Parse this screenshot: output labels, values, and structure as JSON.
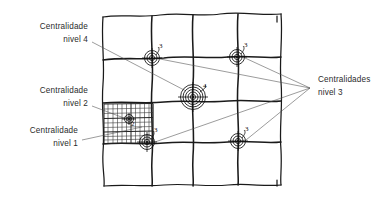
{
  "figure": {
    "type": "hand-drawn-diagram",
    "background_color": "#ffffff",
    "ink_color": "#1a1a1a",
    "leader_color": "#4a4a4a"
  },
  "annotations": [
    {
      "id": "centralidade-nivel-4",
      "line1": "Centralidade",
      "line2": "nivel 4",
      "align": "right",
      "x": 88,
      "y1": 29,
      "y2": 42,
      "target_marker": "center"
    },
    {
      "id": "centralidade-nivel-2",
      "line1": "Centralidade",
      "line2": "nivel 2",
      "align": "right",
      "x": 88,
      "y1": 93,
      "y2": 106,
      "target_marker": "mesh-block"
    },
    {
      "id": "centralidade-nivel-1",
      "line1": "Centralidade",
      "line2": "nivel 1",
      "align": "right",
      "x": 78,
      "y1": 133,
      "y2": 146,
      "target_marker": "mesh-block-lower"
    },
    {
      "id": "centralidades-nivel-3",
      "line1": "Centralidades",
      "line2": "nivel 3",
      "align": "left",
      "x": 318,
      "y1": 82,
      "y2": 95,
      "target_marker": "four-corner-markers"
    }
  ],
  "markers": [
    {
      "id": "marker-top-left",
      "label": "3",
      "cx": 152,
      "cy": 58,
      "rings": 3,
      "radius": 7.5
    },
    {
      "id": "marker-top-right",
      "label": "3",
      "cx": 237,
      "cy": 57,
      "rings": 3,
      "radius": 7.5
    },
    {
      "id": "marker-center",
      "label": "4",
      "cx": 193,
      "cy": 97,
      "rings": 5,
      "radius": 12.5
    },
    {
      "id": "marker-bottom-left",
      "label": "3",
      "cx": 147,
      "cy": 142,
      "rings": 3,
      "radius": 7.5
    },
    {
      "id": "marker-bottom-right",
      "label": "3",
      "cx": 238,
      "cy": 141,
      "rings": 3,
      "radius": 7.5
    },
    {
      "id": "marker-mesh-block",
      "label": "2",
      "cx": 129,
      "cy": 119,
      "rings": 2,
      "radius": 4.5
    }
  ],
  "grid": {
    "description": "Malha urbana ortogonal desenhada a mao livre",
    "vertical_lines": 4,
    "horizontal_lines": 4,
    "frame_left": 103,
    "frame_top": 16,
    "frame_right": 281,
    "frame_bottom": 186
  },
  "mesh_block": {
    "description": "Quadra de malha fina - centralidade nivel 1 e 2",
    "left": 104,
    "top": 104,
    "right": 153,
    "bottom": 142,
    "columns": 11,
    "rows": 8
  }
}
